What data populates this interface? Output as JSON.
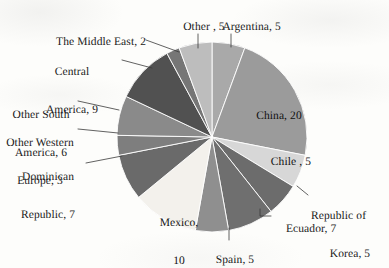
{
  "chart_data": {
    "type": "pie",
    "title": "",
    "subtitle": "",
    "xlabel": "",
    "ylabel": "",
    "legend_position": "none",
    "grid": false,
    "label_format": "name, value",
    "total": 84,
    "start_angle_deg": 0,
    "direction": "clockwise",
    "categories": [
      "Argentina",
      "China",
      "Chile ",
      "Republic of Korea",
      "Ecuador",
      "Spain",
      "Mexico",
      "Dominican Republic",
      "Other Western Europe",
      "Other South America",
      "Central America",
      "The Middle East",
      "Other "
    ],
    "values": [
      5,
      20,
      5,
      5,
      7,
      5,
      10,
      7,
      3,
      6,
      9,
      2,
      5
    ],
    "colors": [
      "#a9a9a9",
      "#9b9b9b",
      "#d7d7d7",
      "#6c6c6c",
      "#6f6f6f",
      "#8f8f8f",
      "#f3f1ec",
      "#6a6a6a",
      "#7e7e7e",
      "#8a8a8a",
      "#515151",
      "#767676",
      "#bdbdbd"
    ],
    "slices": [
      {
        "name": "Argentina",
        "value": 5,
        "label": "Argentina, 5",
        "color": "#a9a9a9",
        "label_placement": "outside"
      },
      {
        "name": "China",
        "value": 20,
        "label": "China, 20",
        "color": "#9b9b9b",
        "label_placement": "inside"
      },
      {
        "name": "Chile ",
        "value": 5,
        "label": "Chile , 5",
        "color": "#d7d7d7",
        "label_placement": "inside"
      },
      {
        "name": "Republic of Korea",
        "value": 5,
        "label": "Republic of Korea, 5",
        "color": "#6c6c6c",
        "label_placement": "outside"
      },
      {
        "name": "Ecuador",
        "value": 7,
        "label": "Ecuador, 7",
        "color": "#6f6f6f",
        "label_placement": "outside"
      },
      {
        "name": "Spain",
        "value": 5,
        "label": "Spain, 5",
        "color": "#8f8f8f",
        "label_placement": "outside"
      },
      {
        "name": "Mexico",
        "value": 10,
        "label": "Mexico, 10",
        "color": "#f3f1ec",
        "label_placement": "inside"
      },
      {
        "name": "Dominican Republic",
        "value": 7,
        "label": "Dominican Republic, 7",
        "color": "#6a6a6a",
        "label_placement": "outside"
      },
      {
        "name": "Other Western Europe",
        "value": 3,
        "label": "Other Western Europe, 3",
        "color": "#7e7e7e",
        "label_placement": "outside"
      },
      {
        "name": "Other South America",
        "value": 6,
        "label": "Other South America, 6",
        "color": "#8a8a8a",
        "label_placement": "outside"
      },
      {
        "name": "Central America",
        "value": 9,
        "label": "Central America, 9",
        "color": "#515151",
        "label_placement": "outside"
      },
      {
        "name": "The Middle East",
        "value": 2,
        "label": "The Middle East, 2",
        "color": "#767676",
        "label_placement": "outside"
      },
      {
        "name": "Other ",
        "value": 5,
        "label": "Other , 5",
        "color": "#bdbdbd",
        "label_placement": "outside"
      }
    ]
  },
  "labels": {
    "other": {
      "line1": "Other , 5"
    },
    "argentina": {
      "line1": "Argentina, 5"
    },
    "middle_east": {
      "line1": "The Middle East, 2"
    },
    "central_america": {
      "line1": "Central",
      "line2": "America, 9"
    },
    "other_south_america": {
      "line1": "Other South",
      "line2": "America, 6"
    },
    "other_western_europe": {
      "line1": "Other Western",
      "line2": "Europe, 3"
    },
    "dominican_republic": {
      "line1": "Dominican",
      "line2": "Republic, 7"
    },
    "china": {
      "line1": "China, 20"
    },
    "chile": {
      "line1": "Chile , 5"
    },
    "republic_of_korea": {
      "line1": "Republic of",
      "line2": "Korea, 5"
    },
    "ecuador": {
      "line1": "Ecuador, 7"
    },
    "spain": {
      "line1": "Spain, 5"
    },
    "mexico": {
      "line1": "Mexico,",
      "line2": "10"
    }
  }
}
